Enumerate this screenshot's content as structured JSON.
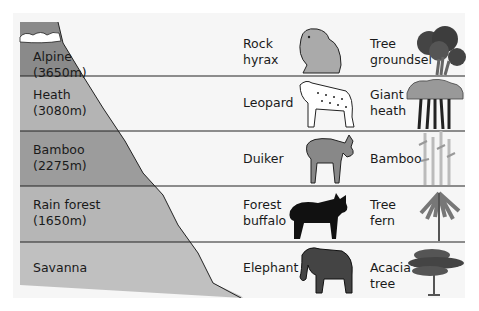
{
  "colors": {
    "alpine": "#8a8a8a",
    "heath": "#b4b4b4",
    "bamboo": "#9c9c9c",
    "rainforest": "#b6b6b6",
    "savanna": "#c0c0c0",
    "background": "#f6f6f6",
    "line": "#222222"
  },
  "zones": [
    {
      "name": "Alpine",
      "altitude": "(3650m)",
      "animal": "Rock hyrax",
      "animal_l1": "Rock",
      "animal_l2": "hyrax",
      "plant_l1": "Tree",
      "plant_l2": "groundsel",
      "animal_icon": "hyrax-icon",
      "plant_icon": "groundsel-icon"
    },
    {
      "name": "Heath",
      "altitude": "(3080m)",
      "animal_l1": "Leopard",
      "animal_l2": "",
      "plant_l1": "Giant",
      "plant_l2": "heath",
      "animal_icon": "leopard-icon",
      "plant_icon": "giant-heath-icon"
    },
    {
      "name": "Bamboo",
      "altitude": "(2275m)",
      "animal_l1": "Duiker",
      "animal_l2": "",
      "plant_l1": "Bamboo",
      "plant_l2": "",
      "animal_icon": "duiker-icon",
      "plant_icon": "bamboo-icon"
    },
    {
      "name": "Rain forest",
      "altitude": "(1650m)",
      "animal_l1": "Forest",
      "animal_l2": "buffalo",
      "plant_l1": "Tree",
      "plant_l2": "fern",
      "animal_icon": "buffalo-icon",
      "plant_icon": "tree-fern-icon"
    },
    {
      "name": "Savanna",
      "altitude": "",
      "animal_l1": "Elephant",
      "animal_l2": "",
      "plant_l1": "Acacia",
      "plant_l2": "tree",
      "animal_icon": "elephant-icon",
      "plant_icon": "acacia-icon"
    }
  ]
}
